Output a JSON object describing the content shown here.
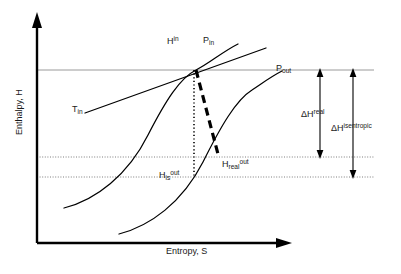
{
  "figure": {
    "type": "enthalpy-entropy-diagram",
    "title_visible": false,
    "background_color": "#ffffff",
    "line_color": "#000000",
    "gridline_color": "#9a9a9a"
  },
  "axes": {
    "y": {
      "label": "Enthalpy, H",
      "arrow": "up",
      "name": "enthalpy-axis"
    },
    "x": {
      "label": "Entropy, S",
      "arrow": "right",
      "name": "entropy-axis"
    }
  },
  "curves": [
    {
      "name": "isobar-inlet",
      "label": "P",
      "label_sub": "in",
      "label_sup": "",
      "style": "solid",
      "description": "inlet pressure isobar"
    },
    {
      "name": "isobar-outlet",
      "label": "P",
      "label_sub": "out",
      "label_sup": "",
      "style": "solid",
      "description": "outlet pressure isobar"
    },
    {
      "name": "isotherm-inlet",
      "label": "T",
      "label_sub": "in",
      "label_sup": "",
      "style": "solid",
      "description": "inlet temperature isotherm"
    },
    {
      "name": "isentropic-path",
      "label": "",
      "label_sub": "",
      "label_sup": "",
      "style": "dotted",
      "description": "vertical constant-entropy path from inlet state to isentropic outlet"
    },
    {
      "name": "real-path",
      "label": "",
      "label_sub": "",
      "label_sup": "",
      "style": "dashed-thick",
      "description": "actual expansion path from inlet state to real outlet"
    }
  ],
  "labels": {
    "h_in": {
      "base": "H",
      "sup": "in",
      "sub": ""
    },
    "p_in": {
      "base": "P",
      "sup": "",
      "sub": "in"
    },
    "p_out": {
      "base": "P",
      "sup": "",
      "sub": "out"
    },
    "t_in": {
      "base": "T",
      "sup": "",
      "sub": "in"
    },
    "h_is_out": {
      "base": "H",
      "sub": "is",
      "sup": "out"
    },
    "h_real_out": {
      "base": "H",
      "sub": "real",
      "sup": "out"
    },
    "dh_real": {
      "base": "ΔH",
      "sup": "real",
      "sub": ""
    },
    "dh_isentropic": {
      "base": "ΔH",
      "sup": "isentropic",
      "sub": ""
    }
  },
  "gridlines": [
    {
      "name": "gridline-h-in",
      "style": "solid",
      "level": "inlet enthalpy"
    },
    {
      "name": "gridline-h-real-out",
      "style": "dotted",
      "level": "real outlet enthalpy"
    },
    {
      "name": "gridline-h-is-out",
      "style": "dotted",
      "level": "isentropic outlet enthalpy"
    }
  ],
  "measures": [
    {
      "name": "delta-h-real",
      "label_base": "ΔH",
      "label_sup": "real",
      "from": "inlet enthalpy",
      "to": "real outlet enthalpy",
      "arrow": "double-headed"
    },
    {
      "name": "delta-h-isentropic",
      "label_base": "ΔH",
      "label_sup": "isentropic",
      "from": "inlet enthalpy",
      "to": "isentropic outlet enthalpy",
      "arrow": "double-headed"
    }
  ]
}
